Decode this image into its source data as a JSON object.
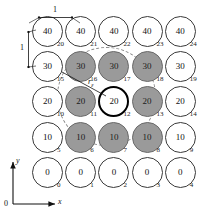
{
  "figure": {
    "grid": {
      "rows": 5,
      "cols": 5,
      "cells": [
        {
          "index": "20",
          "value": "40",
          "state": "plain"
        },
        {
          "index": "21",
          "value": "40",
          "state": "plain"
        },
        {
          "index": "22",
          "value": "40",
          "state": "plain"
        },
        {
          "index": "23",
          "value": "40",
          "state": "plain"
        },
        {
          "index": "24",
          "value": "40",
          "state": "plain"
        },
        {
          "index": "15",
          "value": "30",
          "state": "plain"
        },
        {
          "index": "16",
          "value": "30",
          "state": "shaded"
        },
        {
          "index": "17",
          "value": "30",
          "state": "shaded"
        },
        {
          "index": "18",
          "value": "30",
          "state": "shaded"
        },
        {
          "index": "19",
          "value": "30",
          "state": "plain"
        },
        {
          "index": "10",
          "value": "20",
          "state": "plain"
        },
        {
          "index": "11",
          "value": "20",
          "state": "shaded"
        },
        {
          "index": "12",
          "value": "20",
          "state": "focus"
        },
        {
          "index": "13",
          "value": "20",
          "state": "shaded"
        },
        {
          "index": "14",
          "value": "20",
          "state": "plain"
        },
        {
          "index": "5",
          "value": "10",
          "state": "plain"
        },
        {
          "index": "6",
          "value": "10",
          "state": "shaded"
        },
        {
          "index": "7",
          "value": "10",
          "state": "shaded"
        },
        {
          "index": "8",
          "value": "10",
          "state": "shaded"
        },
        {
          "index": "9",
          "value": "10",
          "state": "plain"
        },
        {
          "index": "0",
          "value": "0",
          "state": "plain"
        },
        {
          "index": "1",
          "value": "0",
          "state": "plain"
        },
        {
          "index": "2",
          "value": "0",
          "state": "plain"
        },
        {
          "index": "3",
          "value": "0",
          "state": "plain"
        },
        {
          "index": "4",
          "value": "0",
          "state": "plain"
        }
      ]
    },
    "dimensions": {
      "horizontal_label": "1",
      "vertical_label": "1"
    },
    "radius_label": {
      "symbol": "r",
      "subscript": "ε"
    },
    "axes": {
      "x_label": "x",
      "y_label": "y",
      "origin_label": "0"
    },
    "colors": {
      "shaded_fill": "#9a9a9a",
      "plain_fill": "#ffffff",
      "outline": "#3a3a3a",
      "focus_outline": "#000000",
      "dashed_circle": "#8d8d8d"
    }
  }
}
